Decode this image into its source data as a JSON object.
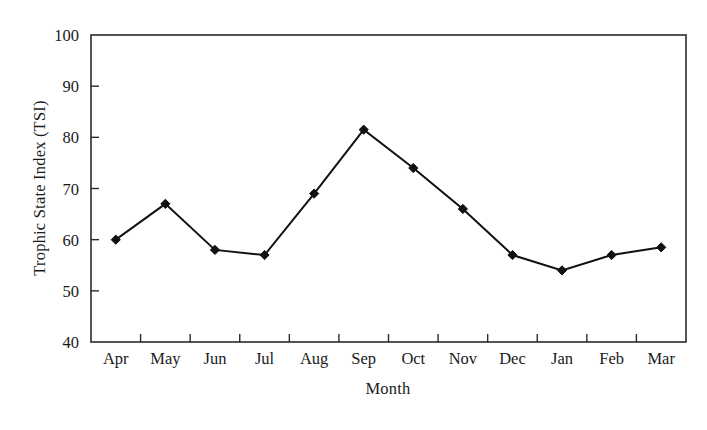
{
  "chart_data": {
    "type": "line",
    "title": "",
    "subtitle": "",
    "xlabel": "Month",
    "ylabel": "Trophic State Index (TSI)",
    "categories": [
      "Apr",
      "May",
      "Jun",
      "Jul",
      "Aug",
      "Sep",
      "Oct",
      "Nov",
      "Dec",
      "Jan",
      "Feb",
      "Mar"
    ],
    "values": [
      60,
      67,
      58,
      57,
      69,
      81.5,
      74,
      66,
      57,
      54,
      57,
      58.5
    ],
    "series": [
      {
        "name": "Trophic State Index (TSI)",
        "values": [
          60,
          67,
          58,
          57,
          69,
          81.5,
          74,
          66,
          57,
          54,
          57,
          58.5
        ]
      }
    ],
    "ylim": [
      40,
      100
    ],
    "yticks": [
      40,
      50,
      60,
      70,
      80,
      90,
      100
    ],
    "ytick_labels": [
      "40",
      "50",
      "60",
      "70",
      "80",
      "90",
      "100"
    ],
    "xtick_labels": [
      "Apr",
      "May",
      "Jun",
      "Jul",
      "Aug",
      "Sep",
      "Oct",
      "Nov",
      "Dec",
      "Jan",
      "Feb",
      "Mar"
    ],
    "grid": false,
    "legend": false,
    "legend_position": "none",
    "marker": "filled-diamond",
    "line_color": "#111111",
    "marker_color": "#111111",
    "axis_color": "#2b2b2b",
    "background_color": "#ffffff",
    "frame": "box"
  },
  "axes": {
    "y_title": "Trophic State Index (TSI)",
    "x_title": "Month"
  }
}
